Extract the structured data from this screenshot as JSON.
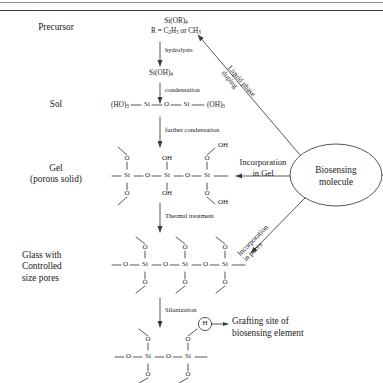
{
  "figure": {
    "line_color": "#3a3a3a",
    "text_color": "#1a1a1a",
    "background": "#ffffff"
  },
  "rows": [
    {
      "id": "precursor",
      "label": "Precursor"
    },
    {
      "id": "sol",
      "label": "Sol"
    },
    {
      "id": "gel",
      "label_line1": "Gel",
      "label_line2": "(porous solid)"
    },
    {
      "id": "glass",
      "label_line1": "Glass with",
      "label_line2": "Controlled",
      "label_line3": "size pores"
    }
  ],
  "formulas": {
    "precursor_1": "Si(OR)",
    "precursor_1_sub": "4",
    "precursor_2_pre": "R = C",
    "precursor_2_sub1": "2",
    "precursor_2_mid": "H",
    "precursor_2_sub2": "5",
    "precursor_2_post": " or CH",
    "precursor_2_sub3": "3",
    "silicic_acid": "Si(OH)",
    "silicic_acid_sub": "4",
    "sol_left": "(HO)",
    "sol_left_sub": "3",
    "sol_si1": "Si",
    "sol_o": "O",
    "sol_si2": "Si",
    "sol_right": "(OH)",
    "sol_right_sub": "3"
  },
  "steps": [
    {
      "id": "hydrolysis",
      "label": "hydrolysis"
    },
    {
      "id": "condensation",
      "label": "condensation"
    },
    {
      "id": "further-condensation",
      "label": "further condensation"
    },
    {
      "id": "thermal-treatment",
      "label": "Thermal treatment"
    },
    {
      "id": "silanization",
      "label": "Silanization"
    }
  ],
  "atoms": {
    "si": "Si",
    "o": "O",
    "oh": "OH",
    "h": "H"
  },
  "biosensing": {
    "ellipse_line1": "Biosensing",
    "ellipse_line2": "molecule",
    "route_liquid_line1": "Liquid phase",
    "route_liquid_line2": "doping",
    "route_gel_line1": "Incorporation",
    "route_gel_line2": "in Gel",
    "route_pores_line1": "Incorporation",
    "route_pores_line2": "in pores"
  },
  "grafting": {
    "line1": "Grafting site of",
    "line2": "biosensing element"
  }
}
